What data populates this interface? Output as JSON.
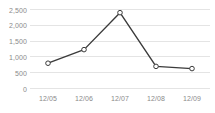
{
  "chart_data": {
    "type": "line",
    "title": "",
    "xlabel": "",
    "ylabel": "",
    "categories": [
      "12/05",
      "12/06",
      "12/07",
      "12/08",
      "12/09"
    ],
    "values": [
      800,
      1230,
      2400,
      700,
      630
    ],
    "series": [
      {
        "name": "",
        "values": [
          800,
          1230,
          2400,
          700,
          630
        ]
      }
    ],
    "ylim": [
      0,
      2500
    ],
    "ytick_values": [
      0,
      500,
      1000,
      1500,
      2000,
      2500
    ],
    "ytick_labels": [
      "0",
      "500",
      "1,000",
      "1,500",
      "2,000",
      "2,500"
    ],
    "xtick_labels": [
      "12/05",
      "12/06",
      "12/07",
      "12/08",
      "12/09"
    ],
    "grid": true,
    "grid_axis": "y",
    "legend": false,
    "legend_position": "none",
    "colors": {
      "line": "#3b3b3b",
      "marker_fill": "#ffffff",
      "marker_stroke": "#3b3b3b",
      "grid": "#e4e4e4",
      "axis_text": "#8a8a8a",
      "background": "#ffffff"
    },
    "marker": "circle",
    "annotations": []
  }
}
